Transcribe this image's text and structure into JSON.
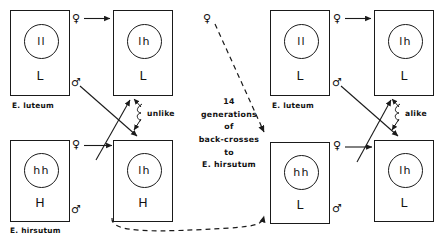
{
  "figure": {
    "center_note_lines": [
      "14",
      "generations",
      "of",
      "back-crosses",
      "to",
      "E. hirsutum"
    ]
  },
  "symbols": {
    "female": "♀",
    "male": "♂"
  },
  "boxes": [
    {
      "id": "box-1",
      "nucleus": "ll",
      "cytoplasm": "L",
      "species": "E. luteum",
      "x": 10,
      "y": 10,
      "w": 60,
      "h": 86
    },
    {
      "id": "box-2",
      "nucleus": "lh",
      "cytoplasm": "L",
      "species": "",
      "x": 113,
      "y": 10,
      "w": 60,
      "h": 86
    },
    {
      "id": "box-3",
      "nucleus": "hh",
      "cytoplasm": "H",
      "species": "E. hirsutum",
      "x": 10,
      "y": 140,
      "w": 60,
      "h": 82
    },
    {
      "id": "box-4",
      "nucleus": "lh",
      "cytoplasm": "H",
      "species": "",
      "x": 113,
      "y": 140,
      "w": 60,
      "h": 82
    },
    {
      "id": "box-5",
      "nucleus": "ll",
      "cytoplasm": "L",
      "species": "E. luteum",
      "x": 270,
      "y": 10,
      "w": 60,
      "h": 86
    },
    {
      "id": "box-6",
      "nucleus": "lh",
      "cytoplasm": "L",
      "species": "",
      "x": 374,
      "y": 10,
      "w": 60,
      "h": 86
    },
    {
      "id": "box-7",
      "nucleus": "hh",
      "cytoplasm": "L",
      "species": "",
      "x": 270,
      "y": 142,
      "w": 60,
      "h": 82
    },
    {
      "id": "box-8",
      "nucleus": "lh",
      "cytoplasm": "L",
      "species": "",
      "x": 374,
      "y": 140,
      "w": 60,
      "h": 82
    }
  ],
  "sex_marks": [
    {
      "id": "sex-left-top-female",
      "symbol": "♀",
      "x": 72,
      "y": 13
    },
    {
      "id": "sex-left-top-male",
      "symbol": "♂",
      "x": 71,
      "y": 77
    },
    {
      "id": "sex-left-bottom-female",
      "symbol": "♀",
      "x": 72,
      "y": 137
    },
    {
      "id": "sex-left-bottom-male",
      "symbol": "♂",
      "x": 71,
      "y": 204
    },
    {
      "id": "sex-right-top-female",
      "symbol": "♀",
      "x": 333,
      "y": 13
    },
    {
      "id": "sex-right-top-male",
      "symbol": "♂",
      "x": 332,
      "y": 77
    },
    {
      "id": "sex-right-bottom-female",
      "symbol": "♀",
      "x": 333,
      "y": 139
    },
    {
      "id": "sex-right-bottom-male",
      "symbol": "♂",
      "x": 332,
      "y": 203
    },
    {
      "id": "sex-mid-top-female",
      "symbol": "♀",
      "x": 203,
      "y": 13
    }
  ],
  "annotations": [
    {
      "id": "unlike-label",
      "text": "unlike",
      "x": 147,
      "y": 113
    },
    {
      "id": "alike-label",
      "text": "alike",
      "x": 405,
      "y": 113
    }
  ]
}
